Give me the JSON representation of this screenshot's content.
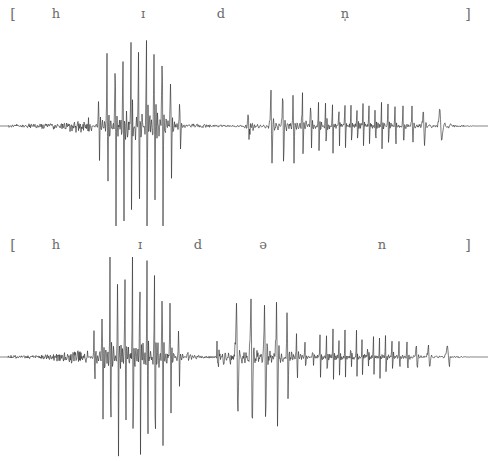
{
  "figure": {
    "background_color": "#ffffff",
    "wave_color": "#2a2a2a",
    "label_color": "#6b6b6b",
    "width": 488,
    "height": 461
  },
  "panels": [
    {
      "id": "panel-top",
      "transcription": "[ h ɪ d n̩ ]",
      "labels": [
        {
          "text": "[",
          "x": 13,
          "name": "open-bracket"
        },
        {
          "text": "h",
          "x": 56,
          "name": "segment-h"
        },
        {
          "text": "ɪ",
          "x": 143,
          "name": "segment-i"
        },
        {
          "text": "d",
          "x": 221,
          "name": "segment-d"
        },
        {
          "text": "n̩",
          "x": 345,
          "name": "segment-syllabic-n"
        },
        {
          "text": "]",
          "x": 468,
          "name": "close-bracket"
        }
      ]
    },
    {
      "id": "panel-bottom",
      "transcription": "[ h ɪ d ə n ]",
      "labels": [
        {
          "text": "[",
          "x": 13,
          "name": "open-bracket"
        },
        {
          "text": "h",
          "x": 56,
          "name": "segment-h"
        },
        {
          "text": "ɪ",
          "x": 140,
          "name": "segment-i"
        },
        {
          "text": "d",
          "x": 198,
          "name": "segment-d"
        },
        {
          "text": "ə",
          "x": 263,
          "name": "segment-schwa"
        },
        {
          "text": "n",
          "x": 382,
          "name": "segment-n"
        },
        {
          "text": "]",
          "x": 468,
          "name": "close-bracket"
        }
      ]
    }
  ],
  "chart_data": {
    "type": "line",
    "xlabel": "",
    "ylabel": "",
    "grid": false,
    "legend": "none",
    "waveforms": [
      {
        "name": "hidden-syllabic-n",
        "transcription": "[ h ɪ d n̩ ]",
        "baseline_y": 131,
        "x_range": [
          8,
          480
        ],
        "ylim": [
          -1,
          1
        ],
        "segments": [
          {
            "label": "h",
            "x_start": 8,
            "x_end": 92,
            "amplitude": 0.07,
            "character": "aperiodic-noise"
          },
          {
            "label": "ɪ",
            "x_start": 92,
            "x_end": 190,
            "amplitude": 1.0,
            "character": "periodic-high-amplitude"
          },
          {
            "label": "d",
            "x_start": 190,
            "x_end": 258,
            "amplitude": 0.09,
            "character": "closure-and-burst"
          },
          {
            "label": "n̩",
            "x_start": 258,
            "x_end": 455,
            "amplitude": 0.35,
            "character": "periodic-nasal-moderate"
          },
          {
            "label": "decay",
            "x_start": 455,
            "x_end": 480,
            "amplitude": 0.04,
            "character": "silence"
          }
        ],
        "pulse_period_px": 9.5
      },
      {
        "name": "hidden-schwa-n",
        "transcription": "[ h ɪ d ə n ]",
        "baseline_y": 375,
        "x_range": [
          8,
          480
        ],
        "ylim": [
          -1,
          1
        ],
        "segments": [
          {
            "label": "h",
            "x_start": 8,
            "x_end": 88,
            "amplitude": 0.07,
            "character": "aperiodic-noise"
          },
          {
            "label": "ɪ",
            "x_start": 88,
            "x_end": 190,
            "amplitude": 1.0,
            "character": "periodic-high-amplitude"
          },
          {
            "label": "d",
            "x_start": 190,
            "x_end": 222,
            "amplitude": 0.1,
            "character": "closure-and-burst"
          },
          {
            "label": "ə",
            "x_start": 222,
            "x_end": 310,
            "amplitude": 0.62,
            "character": "periodic-vowel-moderate"
          },
          {
            "label": "n",
            "x_start": 310,
            "x_end": 450,
            "amplitude": 0.26,
            "character": "periodic-nasal-moderate"
          },
          {
            "label": "decay",
            "x_start": 450,
            "x_end": 480,
            "amplitude": 0.03,
            "character": "silence"
          }
        ],
        "pulse_period_px": 9.0
      }
    ]
  }
}
